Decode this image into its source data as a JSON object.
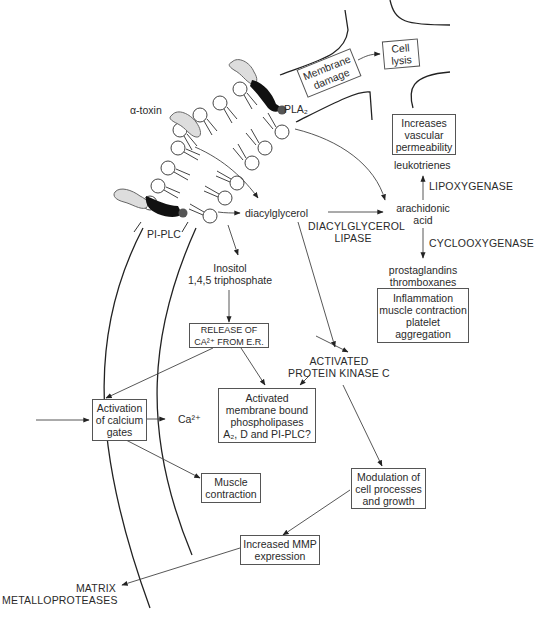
{
  "diagram": {
    "type": "signaling pathway",
    "nodes": {
      "alpha_toxin": "α-toxin",
      "pla2": "PLA₂",
      "pi_plc": "PI-PLC",
      "membrane_damage": [
        "Membrane",
        "damage"
      ],
      "cell_lysis": [
        "Cell",
        "lysis"
      ],
      "increases_vascular_permeability": [
        "Increases",
        "vascular",
        "permeability"
      ],
      "leukotrienes": "leukotrienes",
      "lipoxygenase": "LIPOXYGENASE",
      "arachidonic_acid": [
        "arachidonic",
        "acid"
      ],
      "diacylglycerol": "diacylglycerol",
      "diacylglycerol_lipase": [
        "DIACYLGLYCEROL",
        "LIPASE"
      ],
      "cyclooxygenase": "CYCLOOXYGENASE",
      "prostaglandins": [
        "prostaglandins",
        "thromboxanes"
      ],
      "inflammation": [
        "Inflammation",
        "muscle contraction",
        "platelet",
        "aggregation"
      ],
      "inositol": [
        "Inositol",
        "1,4,5 triphosphate"
      ],
      "release_ca": [
        "RELEASE OF",
        "CA²⁺ FROM E.R."
      ],
      "activated_pkc": [
        "ACTIVATED",
        "PROTEIN KINASE C"
      ],
      "activated_phospholipases": [
        "Activated",
        "membrane bound",
        "phospholipases",
        "A₂, D and PI-PLC?"
      ],
      "activation_calcium_gates": [
        "Activation",
        "of calcium",
        "gates"
      ],
      "ca2": "Ca²⁺",
      "muscle_contraction": [
        "Muscle",
        "contraction"
      ],
      "modulation": [
        "Modulation of",
        "cell processes",
        "and growth"
      ],
      "increased_mmp": [
        "Increased MMP",
        "expression"
      ],
      "matrix_mmp": [
        "MATRIX",
        "METALLOPROTEASES"
      ]
    },
    "edges": [
      [
        "membrane_damage",
        "cell_lysis"
      ],
      [
        "pla2",
        "arachidonic_acid"
      ],
      [
        "membrane",
        "diacylglycerol"
      ],
      [
        "diacylglycerol",
        "arachidonic_acid"
      ],
      [
        "arachidonic_acid",
        "leukotrienes"
      ],
      [
        "arachidonic_acid",
        "prostaglandins"
      ],
      [
        "pi_plc",
        "inositol"
      ],
      [
        "inositol",
        "release_ca"
      ],
      [
        "release_ca",
        "activated_pkc"
      ],
      [
        "release_ca",
        "activated_phospholipases"
      ],
      [
        "release_ca",
        "activation_calcium_gates"
      ],
      [
        "activated_pkc",
        "activated_phospholipases"
      ],
      [
        "diacylglycerol",
        "activated_pkc"
      ],
      [
        "diacylglycerol",
        "modulation"
      ],
      [
        "activation_calcium_gates",
        "ca2"
      ],
      [
        "activation_calcium_gates",
        "muscle_contraction"
      ],
      [
        "modulation",
        "increased_mmp"
      ],
      [
        "increased_mmp",
        "matrix_mmp"
      ]
    ]
  }
}
